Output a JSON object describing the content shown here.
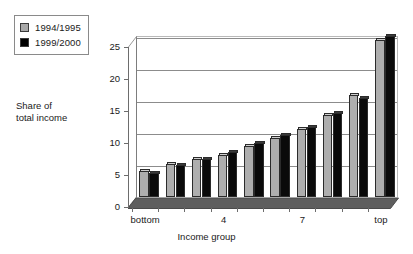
{
  "legend": {
    "position": "top-left",
    "entries": [
      {
        "label": "1994/1995",
        "color": "#aeaeae",
        "swatch": "gray-square-icon"
      },
      {
        "label": "1999/2000",
        "color": "#0a0a0a",
        "swatch": "black-square-icon"
      }
    ]
  },
  "axis": {
    "y_caption_line1": "Share of",
    "y_caption_line2": "total income",
    "x_title": "Income group"
  },
  "chart_data": {
    "type": "bar",
    "title": "",
    "subtitle": "",
    "xlabel": "Income group",
    "ylabel": "Share of total income",
    "ylim": [
      0,
      25
    ],
    "yticks": [
      0,
      5,
      10,
      15,
      20,
      25
    ],
    "ytick_labels": [
      "0",
      "5",
      "10",
      "15",
      "20",
      "25"
    ],
    "grid": true,
    "grid_axis": "y",
    "legend_position": "top-left",
    "style": "3d-clustered-column",
    "categories": [
      "bottom",
      "2",
      "3",
      "4",
      "5",
      "6",
      "7",
      "8",
      "9",
      "top"
    ],
    "xtick_labels_shown": [
      "bottom",
      "",
      "",
      "4",
      "",
      "",
      "7",
      "",
      "",
      "top"
    ],
    "series": [
      {
        "name": "1994/1995",
        "color": "#aeaeae",
        "values": [
          4.0,
          5.1,
          6.0,
          6.6,
          7.9,
          9.2,
          10.6,
          12.8,
          15.9,
          24.6
        ]
      },
      {
        "name": "1999/2000",
        "color": "#0a0a0a",
        "values": [
          3.8,
          5.0,
          6.0,
          7.1,
          8.5,
          9.7,
          11.0,
          13.1,
          15.5,
          25.1
        ]
      }
    ]
  }
}
